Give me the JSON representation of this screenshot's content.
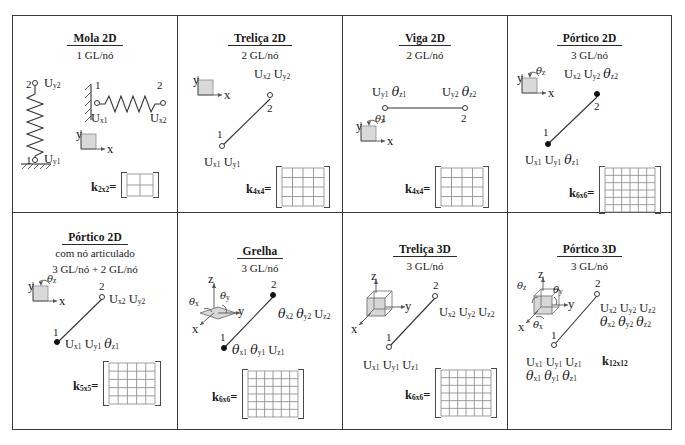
{
  "figure": {
    "kind": "finite-element-types-table",
    "rows": 2,
    "cols": 4
  },
  "cells": [
    {
      "id": "mola-2d",
      "title": "Mola 2D",
      "subtitle": "1 GL/nó",
      "subtitle2": "",
      "stiffness": "k",
      "stiffness_sub": "2x2",
      "matrix_n": 2,
      "node_labels": [
        "2",
        "1",
        "1",
        "2"
      ],
      "dofs": [
        "U",
        "y2",
        "U",
        "y1",
        "U",
        "x1",
        "U",
        "x2"
      ],
      "axis_icon": "axes-2d-xy",
      "element_icon": "spring"
    },
    {
      "id": "trelica-2d",
      "title": "Treliça 2D",
      "subtitle": "2 GL/nó",
      "subtitle2": "",
      "stiffness": "k",
      "stiffness_sub": "4x4",
      "matrix_n": 4,
      "node_labels": [
        "2",
        "1"
      ],
      "dof_top": "U x2  U y2",
      "dof_bottom": "U x1  U y1",
      "axis_icon": "axes-2d-xy",
      "element_icon": "diagonal-bar-hollow-nodes"
    },
    {
      "id": "viga-2d",
      "title": "Viga 2D",
      "subtitle": "2 GL/nó",
      "subtitle2": "",
      "stiffness": "k",
      "stiffness_sub": "4x4",
      "matrix_n": 4,
      "node_labels": [
        "1",
        "2"
      ],
      "dof_left": "U y1  θ z1",
      "dof_right": "U y2  θ z2",
      "axis_icon": "axes-2d-xy-theta-z",
      "element_icon": "horizontal-beam-hollow-nodes"
    },
    {
      "id": "portico-2d",
      "title": "Pórtico 2D",
      "subtitle": "3 GL/nó",
      "subtitle2": "",
      "stiffness": "k",
      "stiffness_sub": "6x6",
      "matrix_n": 6,
      "node_labels": [
        "2",
        "1"
      ],
      "dof_top": "U x2  U y2  θ z2",
      "dof_bottom": "U x1  U y1  θ z1",
      "axis_icon": "axes-2d-xy-theta-z",
      "element_icon": "diagonal-bar-filled-nodes"
    },
    {
      "id": "portico-2d-articulado",
      "title": "Pórtico 2D",
      "subtitle": "com nó articulado",
      "subtitle2": "3 GL/nó + 2 GL/nó",
      "stiffness": "k",
      "stiffness_sub": "5x5",
      "matrix_n": 5,
      "node_labels": [
        "2",
        "1"
      ],
      "dof_top": "U x2  U y2",
      "dof_bottom": "U x1  U y1  θ z1",
      "axis_icon": "axes-2d-xy-theta-z",
      "element_icon": "diagonal-bar-mixed-nodes"
    },
    {
      "id": "grelha",
      "title": "Grelha",
      "subtitle": "3 GL/nó",
      "subtitle2": "",
      "stiffness": "k",
      "stiffness_sub": "6x6",
      "matrix_n": 6,
      "node_labels": [
        "2",
        "1"
      ],
      "dof_top": "θ x2  θ y2  U z2",
      "dof_bottom": "θ x1  θ y1  U z1",
      "axis_icon": "axes-3d-plate-theta",
      "element_icon": "diagonal-bar-filled-nodes"
    },
    {
      "id": "trelica-3d",
      "title": "Treliça 3D",
      "subtitle": "3 GL/nó",
      "subtitle2": "",
      "stiffness": "k",
      "stiffness_sub": "6x6",
      "matrix_n": 6,
      "node_labels": [
        "2",
        "1"
      ],
      "dof_top": "U x2  U y2  U z2",
      "dof_bottom": "U x1  U y1  U z1",
      "axis_icon": "axes-3d-cube",
      "element_icon": "diagonal-bar-hollow-nodes"
    },
    {
      "id": "portico-3d",
      "title": "Pórtico 3D",
      "subtitle": "3 GL/nó",
      "subtitle2": "",
      "stiffness": "k",
      "stiffness_sub": "12x12",
      "matrix_n": 0,
      "node_labels": [
        "2",
        "1"
      ],
      "dof_top_u": "U x2  U y2  U z2",
      "dof_top_t": "θ x2  θ y2  θ z2",
      "dof_bottom_u": "U x1  U y1  U z1",
      "dof_bottom_t": "θ x1  θ y1  θ z1",
      "axis_icon": "axes-3d-cube-theta",
      "element_icon": "diagonal-bar-hollow-nodes"
    }
  ],
  "symbols": {
    "U": "U",
    "theta": "θ",
    "k": "k",
    "x": "x",
    "y": "y",
    "z": "z"
  },
  "colors": {
    "ink": "#1a1a1a",
    "rule": "#3a3a3a",
    "grid": "#8d8d8d",
    "axis_fill": "#d9d9d9"
  }
}
